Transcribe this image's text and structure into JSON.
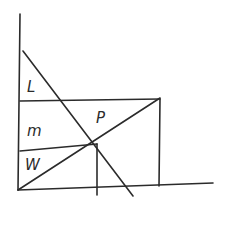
{
  "diagram": {
    "type": "hand-drawn geometric sketch",
    "stroke_color": "#2b2b2b",
    "background": "#ffffff",
    "labels": {
      "top_region": "L",
      "middle_region": "m",
      "bottom_region": "W",
      "intersection_point": "P"
    },
    "lines": {
      "y_axis": {
        "x1": 20,
        "y1": 14,
        "x2": 18,
        "y2": 190
      },
      "x_axis": {
        "x1": 18,
        "y1": 190,
        "x2": 213,
        "y2": 183
      },
      "falling_diagonal": {
        "x1": 23,
        "y1": 51,
        "x2": 133,
        "y2": 196
      },
      "rising_diagonal": {
        "x1": 18,
        "y1": 190,
        "x2": 160,
        "y2": 98
      },
      "top_horizontal": {
        "x1": 20,
        "y1": 101,
        "x2": 160,
        "y2": 99
      },
      "mid_horizontal": {
        "x1": 20,
        "y1": 151,
        "x2": 97,
        "y2": 144
      },
      "right_vertical": {
        "x1": 160,
        "y1": 99,
        "x2": 159,
        "y2": 186
      },
      "p_vertical": {
        "x1": 97,
        "y1": 144,
        "x2": 97,
        "y2": 195
      }
    },
    "label_positions": {
      "top_region": {
        "x": 27,
        "y": 92
      },
      "middle_region": {
        "x": 27,
        "y": 136
      },
      "bottom_region": {
        "x": 25,
        "y": 170
      },
      "intersection_point": {
        "x": 96,
        "y": 123
      }
    }
  }
}
